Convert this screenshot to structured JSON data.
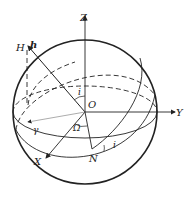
{
  "figure": {
    "colors": {
      "stroke": "#222222",
      "thin": "#666666",
      "background": "#ffffff"
    },
    "labels": {
      "z_axis": "Z",
      "y_axis": "Y",
      "x_axis": "X",
      "origin": "O",
      "h_vector": "h",
      "h_point": "H",
      "node": "N",
      "node_longitude": "Ω",
      "inclination_top": "i",
      "inclination_node": "i",
      "vernal_equinox": "γ"
    }
  }
}
